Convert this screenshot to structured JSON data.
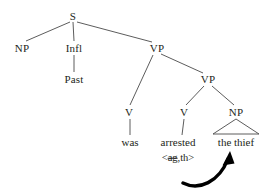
{
  "figure": {
    "kind": "syntax-tree-diagram",
    "colors": {
      "background": "#ffffff",
      "ink": "#231f20",
      "branch_line": "#4a4a4a",
      "arrow": "#000000"
    }
  },
  "nodes": {
    "s": {
      "label": "S",
      "x": 73,
      "y": 16
    },
    "np_subject": {
      "label": "NP",
      "x": 22,
      "y": 48
    },
    "infl": {
      "label": "Infl",
      "x": 74,
      "y": 48
    },
    "past": {
      "label": "Past",
      "x": 74,
      "y": 79
    },
    "vp_upper": {
      "label": "VP",
      "x": 157,
      "y": 48
    },
    "vp_lower": {
      "label": "VP",
      "x": 208,
      "y": 79
    },
    "v_aux": {
      "label": "V",
      "x": 129,
      "y": 112
    },
    "v_main": {
      "label": "V",
      "x": 184,
      "y": 112
    },
    "np_object": {
      "label": "NP",
      "x": 236,
      "y": 112
    }
  },
  "terminals": {
    "was": {
      "label": "was",
      "x": 130,
      "y": 142
    },
    "arrested": {
      "label": "arrested",
      "x": 178,
      "y": 142
    },
    "the_thief": {
      "label": "the thief",
      "x": 236,
      "y": 142
    }
  },
  "annotation": {
    "theta_grid": {
      "open": "<",
      "suppressed_role": "ag",
      "separator": ",",
      "active_role": "th",
      "close": ">",
      "x": 178,
      "y": 158
    }
  },
  "movement_arrow": {
    "from_label": "arrested <ag,th>",
    "to_label": "the thief",
    "path": "M 184 182 C 200 190, 220 180, 229 157",
    "head": "M 229 157 L 224 167 L 234 165 Z"
  },
  "branches": [
    {
      "name": "s-to-np",
      "x1": 70,
      "y1": 22,
      "x2": 26,
      "y2": 41
    },
    {
      "name": "s-to-infl",
      "x1": 73,
      "y1": 22,
      "x2": 74,
      "y2": 41
    },
    {
      "name": "s-to-vp",
      "x1": 77,
      "y1": 22,
      "x2": 152,
      "y2": 42
    },
    {
      "name": "infl-to-past",
      "x1": 74,
      "y1": 55,
      "x2": 74,
      "y2": 72
    },
    {
      "name": "vpupper-to-v",
      "x1": 153,
      "y1": 55,
      "x2": 130,
      "y2": 105
    },
    {
      "name": "vpupper-to-vp",
      "x1": 161,
      "y1": 54,
      "x2": 203,
      "y2": 73
    },
    {
      "name": "vplower-to-v",
      "x1": 204,
      "y1": 86,
      "x2": 186,
      "y2": 105
    },
    {
      "name": "vplower-to-np",
      "x1": 212,
      "y1": 86,
      "x2": 234,
      "y2": 105
    },
    {
      "name": "v-to-was",
      "x1": 130,
      "y1": 119,
      "x2": 130,
      "y2": 135
    },
    {
      "name": "v-to-arrested",
      "x1": 184,
      "y1": 119,
      "x2": 182,
      "y2": 135
    }
  ],
  "np_triangle": {
    "name": "np-object-triangle",
    "apex_x": 236,
    "apex_y": 119,
    "left_x": 213,
    "left_y": 134,
    "right_x": 259,
    "right_y": 134
  }
}
